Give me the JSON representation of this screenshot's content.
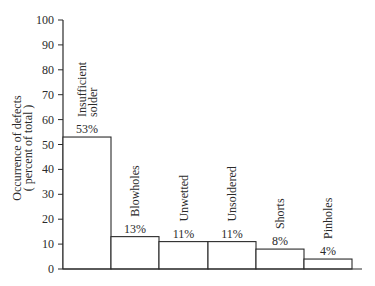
{
  "chart_data": {
    "type": "bar",
    "title": "",
    "xlabel": "",
    "ylabel": "Occurrence of defects (percent of total)",
    "ylabel_lines": [
      "Occurrence of defects",
      "( percent of total )"
    ],
    "ylim": [
      0,
      100
    ],
    "yticks": [
      0,
      10,
      20,
      30,
      40,
      50,
      60,
      70,
      80,
      90,
      100
    ],
    "grid": false,
    "legend": null,
    "categories": [
      "Insufficient solder",
      "Blowholes",
      "Unwetted",
      "Unsoldered",
      "Shorts",
      "Pinholes"
    ],
    "category_label_lines": [
      [
        "Insufficient",
        "solder"
      ],
      [
        "Blowholes"
      ],
      [
        "Unwetted"
      ],
      [
        "Unsoldered"
      ],
      [
        "Shorts"
      ],
      [
        "Pinholes"
      ]
    ],
    "values": [
      53,
      13,
      11,
      11,
      8,
      4
    ],
    "value_labels": [
      "53%",
      "13%",
      "11%",
      "11%",
      "8%",
      "4%"
    ],
    "bar_fill": "#ffffff",
    "bar_stroke": "#2a2a2a"
  }
}
